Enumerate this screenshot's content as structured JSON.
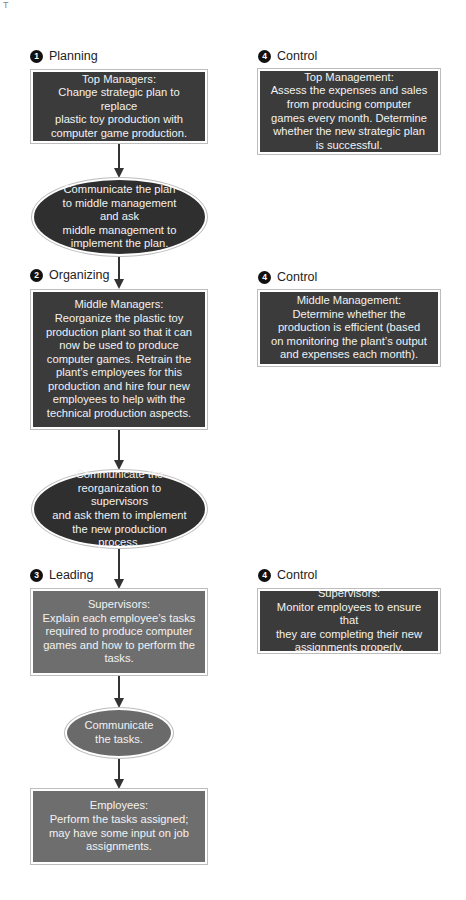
{
  "corner_mark": "T",
  "colors": {
    "dark_box": "#3b3b3b",
    "gray_box": "#6e6e6e",
    "dark_ellipse": "#2f2f2f",
    "gray_ellipse": "#6a6a6a",
    "badge": "#111111",
    "arrow": "#333333"
  },
  "flow": {
    "planning": {
      "badge": "1",
      "label": "Planning",
      "box": {
        "title": "Top Managers:",
        "text": "Change strategic plan to replace\nplastic toy production with\ncomputer game production."
      }
    },
    "communicate_1": {
      "text": "Communicate the plan\nto middle management and ask\nmiddle management to\nimplement the plan."
    },
    "organizing": {
      "badge": "2",
      "label": "Organizing",
      "box": {
        "title": "Middle Managers:",
        "text": "Reorganize the plastic toy\nproduction plant so that it can\nnow be used to produce\ncomputer games. Retrain the\nplant’s employees for this\nproduction and hire four new\nemployees to help with the\ntechnical production aspects."
      }
    },
    "communicate_2": {
      "text": "Communicate the\nreorganization to supervisors\nand ask them to implement\nthe new production\nprocess."
    },
    "leading": {
      "badge": "3",
      "label": "Leading",
      "box": {
        "title": "Supervisors:",
        "text": "Explain each employee’s tasks\nrequired to produce computer\ngames and how to perform the\ntasks."
      }
    },
    "communicate_3": {
      "text": "Communicate\nthe tasks."
    },
    "employees": {
      "box": {
        "title": "Employees:",
        "text": "Perform the tasks assigned;\nmay have some input on job\nassignments."
      }
    }
  },
  "control": [
    {
      "badge": "4",
      "label": "Control",
      "title": "Top Management:",
      "text": "Assess the expenses and sales\nfrom producing computer\ngames every month. Determine\nwhether the new strategic plan\nis successful."
    },
    {
      "badge": "4",
      "label": "Control",
      "title": "Middle Management:",
      "text": "Determine whether the\nproduction is efficient (based\non monitoring the plant’s output\nand expenses each month)."
    },
    {
      "badge": "4",
      "label": "Control",
      "title": "Supervisors:",
      "text": "Monitor employees to ensure that\nthey are completing their new\nassignments properly."
    }
  ]
}
